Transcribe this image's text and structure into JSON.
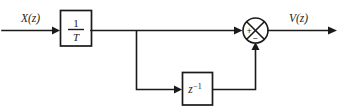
{
  "diagram": {
    "colors": {
      "line": "#1a1a1a",
      "background": "#ffffff",
      "block_fill": "#ffffff"
    },
    "input": {
      "label": "X(z)",
      "label_variable": "X",
      "label_arg": "(z)"
    },
    "output": {
      "label": "V(z)",
      "label_variable": "V",
      "label_arg": "(z)"
    },
    "blocks": [
      {
        "id": "gain-block",
        "label": "1/T",
        "numerator": "1",
        "denominator": "T",
        "kind": "fraction"
      },
      {
        "id": "delay-block",
        "label": "z-1",
        "base": "z",
        "exponent": "−1",
        "kind": "power"
      }
    ],
    "summing_junction": {
      "id": "summer",
      "symbol": "cross-circle",
      "positive_sign": "+",
      "negative_sign": "−",
      "positive_input": "main-path",
      "negative_input": "feedback-path"
    },
    "wires": [
      {
        "id": "input-wire",
        "from": "X(z)",
        "to": "1/T"
      },
      {
        "id": "gain-to-summer",
        "from": "1/T",
        "to": "summer-plus"
      },
      {
        "id": "branch-to-delay",
        "from": "branch-node",
        "to": "z-1"
      },
      {
        "id": "delay-to-summer",
        "from": "z-1",
        "to": "summer-minus"
      },
      {
        "id": "output-wire",
        "from": "summer",
        "to": "V(z)"
      }
    ]
  }
}
